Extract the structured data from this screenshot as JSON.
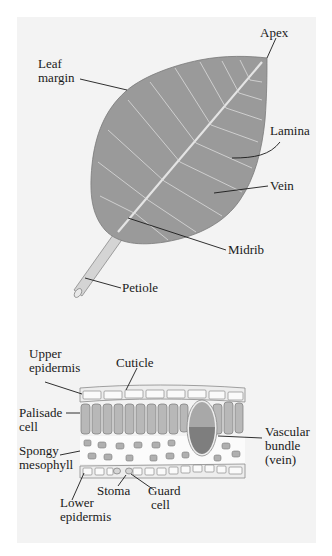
{
  "figure": {
    "background": "#f3f3f3",
    "leaf_color": "#9a9a9a",
    "vein_color": "#e6e6e6",
    "leaf_labels": {
      "apex": "Apex",
      "leaf_margin_1": "Leaf",
      "leaf_margin_2": "margin",
      "lamina": "Lamina",
      "vein": "Vein",
      "midrib": "Midrib",
      "petiole": "Petiole"
    },
    "cross_section_labels": {
      "upper_epidermis_1": "Upper",
      "upper_epidermis_2": "epidermis",
      "cuticle": "Cuticle",
      "palisade_1": "Palisade",
      "palisade_2": "cell",
      "spongy_1": "Spongy",
      "spongy_2": "mesophyll",
      "vascular_1": "Vascular",
      "vascular_2": "bundle",
      "vascular_3": "(vein)",
      "stoma": "Stoma",
      "guard_1": "Guard",
      "guard_2": "cell",
      "lower_1": "Lower",
      "lower_2": "epidermis"
    },
    "vascular_colors": {
      "xylem": "#a8a8a8",
      "phloem": "#7e7e7e"
    }
  }
}
